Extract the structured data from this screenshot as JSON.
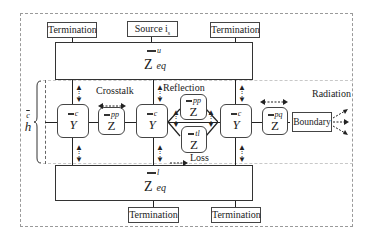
{
  "diagram": {
    "top_boxes": [
      {
        "label": "Termination"
      },
      {
        "label": "Source i",
        "subscript": "s"
      },
      {
        "label": "Termination"
      }
    ],
    "bottom_boxes": [
      {
        "label": "Termination"
      },
      {
        "label": "Termination"
      }
    ],
    "upper_equivalent": {
      "symbol": "Z",
      "superscript": "u",
      "subscript": "eq"
    },
    "lower_equivalent": {
      "symbol": "Z",
      "superscript": "l",
      "subscript": "eq"
    },
    "height_label": {
      "symbol": "h",
      "superscript": "c"
    },
    "nodes": [
      {
        "id": "Y1",
        "symbol": "Y",
        "superscript": "c"
      },
      {
        "id": "Zpp1",
        "symbol": "Z",
        "superscript": "pp"
      },
      {
        "id": "Y2",
        "symbol": "Y",
        "superscript": "c"
      },
      {
        "id": "Zpp2",
        "symbol": "Z",
        "superscript": "pp"
      },
      {
        "id": "Ztl",
        "symbol": "Z",
        "superscript": "tl"
      },
      {
        "id": "Y3",
        "symbol": "Y",
        "superscript": "c"
      },
      {
        "id": "Zpq",
        "symbol": "Z",
        "superscript": "pq"
      }
    ],
    "boundary_label": "Boundary",
    "annotations": {
      "crosstalk": "Crosstalk",
      "reflection": "Reflection",
      "loss": "Loss",
      "radiation": "Radiation"
    }
  }
}
